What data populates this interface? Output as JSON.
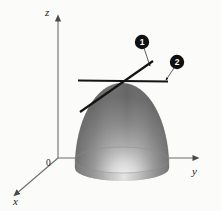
{
  "figure": {
    "background_color": "#fbfbf9",
    "axes": {
      "origin_label": "0",
      "x_label": "x",
      "y_label": "y",
      "z_label": "z",
      "axis_color": "#6d6d6d"
    },
    "callouts": [
      {
        "id": "callout-1",
        "label": "1",
        "disc_color": "#101010",
        "text_color": "#ffffff"
      },
      {
        "id": "callout-2",
        "label": "2",
        "disc_color": "#101010",
        "text_color": "#ffffff"
      }
    ],
    "surface": {
      "name": "paraboloid",
      "fill_dark": "#6f6f6f",
      "fill_mid": "#8d8d8d",
      "fill_light": "#e8e8e8",
      "rim_color": "#8e8e8e"
    },
    "tangent_lines": [
      {
        "name": "tangent-line-1",
        "stroke": "#141414",
        "orientation": "sloped"
      },
      {
        "name": "tangent-line-2",
        "stroke": "#141414",
        "orientation": "horizontal"
      }
    ]
  }
}
